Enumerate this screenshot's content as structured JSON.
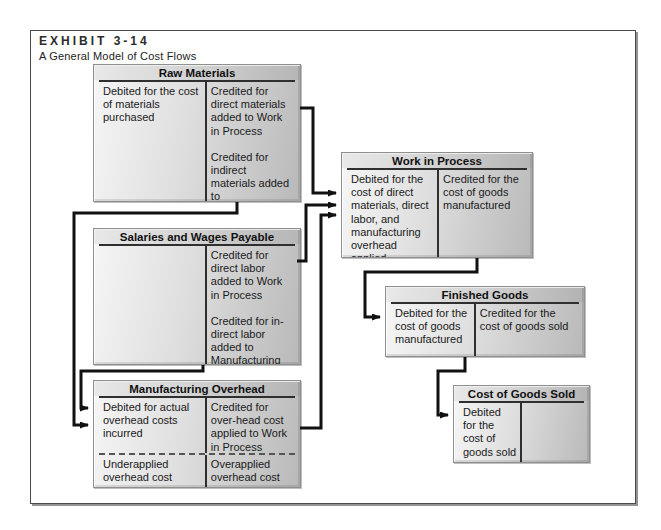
{
  "header": {
    "exhibit": "EXHIBIT 3-14",
    "subtitle": "A General Model of Cost Flows"
  },
  "accounts": {
    "raw_materials": {
      "title": "Raw Materials",
      "debit": [
        "Debited for the cost of materials purchased"
      ],
      "credit": [
        "Credited for direct materials added to Work in Process",
        "Credited for indirect materials added to Manufacturing Overhead"
      ]
    },
    "salaries_wages": {
      "title": "Salaries and Wages Payable",
      "debit": [],
      "credit": [
        "Credited for direct labor added to Work in Process",
        "Credited for in-direct labor added to Manufacturing Overhead"
      ]
    },
    "manufacturing_overhead": {
      "title": "Manufacturing Overhead",
      "debit": [
        "Debited for actual overhead costs incurred"
      ],
      "credit": [
        "Credited for over-head cost applied to Work in Process"
      ],
      "debit_below": "Underapplied overhead cost",
      "credit_below": "Overapplied overhead cost"
    },
    "work_in_process": {
      "title": "Work in Process",
      "debit": [
        "Debited for the cost of direct materials, direct labor, and manufacturing overhead applied"
      ],
      "credit": [
        "Credited for the cost of goods manufactured"
      ]
    },
    "finished_goods": {
      "title": "Finished Goods",
      "debit": [
        "Debited for the cost of goods manufactured"
      ],
      "credit": [
        "Credited for the cost of goods sold"
      ]
    },
    "cost_of_goods_sold": {
      "title": "Cost of Goods Sold",
      "debit": [
        "Debited for the cost of goods sold"
      ],
      "credit": []
    }
  },
  "flows": [
    {
      "from": "Raw Materials",
      "to": "Work in Process"
    },
    {
      "from": "Raw Materials",
      "to": "Manufacturing Overhead"
    },
    {
      "from": "Salaries and Wages Payable",
      "to": "Work in Process"
    },
    {
      "from": "Salaries and Wages Payable",
      "to": "Manufacturing Overhead"
    },
    {
      "from": "Manufacturing Overhead",
      "to": "Work in Process"
    },
    {
      "from": "Work in Process",
      "to": "Finished Goods"
    },
    {
      "from": "Finished Goods",
      "to": "Cost of Goods Sold"
    }
  ],
  "colors": {
    "arrow": "#111111",
    "box_border": "#8f8f8f",
    "box_gradient_light": "#f6f6f6",
    "box_gradient_dark": "#b9b9b9",
    "account_rule": "#2f2f2f",
    "frame_border": "#4a4a4a",
    "text": "#1a1a1a"
  }
}
